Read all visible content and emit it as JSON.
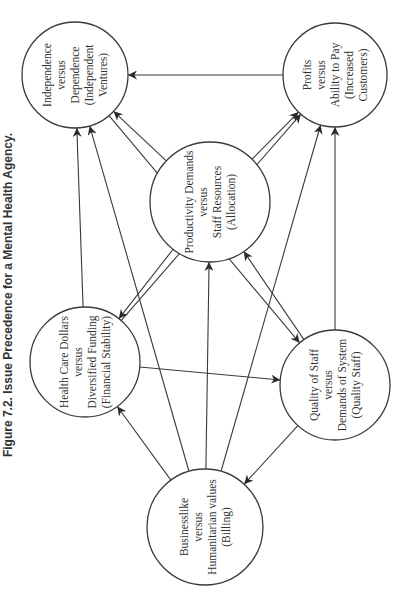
{
  "figure": {
    "caption": "Figure 7.2. Issue Precedence for a Mental Health Agency."
  },
  "nodes": [
    {
      "id": "independence",
      "lines": [
        "Independence",
        "versus",
        "Dependence",
        "(Independent",
        "Ventures)"
      ],
      "cx": 75,
      "cy": 75,
      "r": 53
    },
    {
      "id": "profits",
      "lines": [
        "Profits",
        "versus",
        "Ability to Pay",
        "(Increased",
        "Customers)"
      ],
      "cx": 335,
      "cy": 75,
      "r": 52
    },
    {
      "id": "productivity",
      "lines": [
        "Productivity Demands",
        "versus",
        "Staff Resources",
        "(Allocation)"
      ],
      "cx": 210,
      "cy": 202,
      "r": 60
    },
    {
      "id": "health_care",
      "lines": [
        "Health Care Dollars",
        "versus",
        "Diversified Funding",
        "(Financial Stability)"
      ],
      "cx": 85,
      "cy": 362,
      "r": 55
    },
    {
      "id": "quality",
      "lines": [
        "Quality of Staff",
        "versus",
        "Demands of System",
        "(Quality Staff)"
      ],
      "cx": 335,
      "cy": 385,
      "r": 55
    },
    {
      "id": "billing",
      "lines": [
        "Businesslike",
        "versus",
        "Humanitarian values",
        "(Billing)"
      ],
      "cx": 205,
      "cy": 527,
      "r": 58
    }
  ],
  "edges": [
    {
      "from": "profits",
      "to": "independence"
    },
    {
      "from": "independence",
      "to": "quality"
    },
    {
      "from": "health_care",
      "to": "independence"
    },
    {
      "from": "billing",
      "to": "independence"
    },
    {
      "from": "productivity",
      "to": "independence"
    },
    {
      "from": "health_care",
      "to": "profits"
    },
    {
      "from": "productivity",
      "to": "profits"
    },
    {
      "from": "billing",
      "to": "profits"
    },
    {
      "from": "quality",
      "to": "profits"
    },
    {
      "from": "productivity",
      "to": "health_care"
    },
    {
      "from": "billing",
      "to": "productivity"
    },
    {
      "from": "quality",
      "to": "productivity"
    },
    {
      "from": "health_care",
      "to": "quality"
    },
    {
      "from": "billing",
      "to": "health_care"
    },
    {
      "from": "quality",
      "to": "billing"
    }
  ],
  "colors": {
    "stroke": "#3a3a3a",
    "text": "#333333",
    "background": "#ffffff"
  }
}
